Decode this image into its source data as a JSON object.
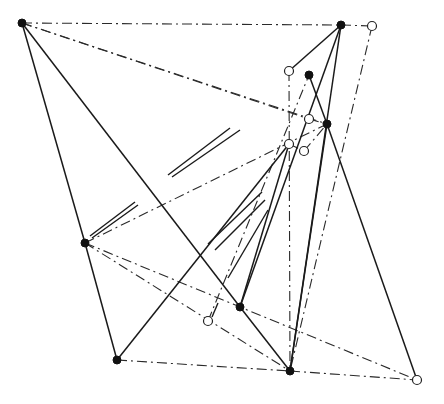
{
  "diagram": {
    "width": 444,
    "height": 404,
    "colors": {
      "line": "#1a1a1a",
      "background": "#ffffff"
    },
    "points": {
      "A": {
        "x": 22,
        "y": 23,
        "type": "filled"
      },
      "B": {
        "x": 341,
        "y": 25,
        "type": "filled"
      },
      "C": {
        "x": 372,
        "y": 26,
        "type": "hollow"
      },
      "D": {
        "x": 289,
        "y": 71,
        "type": "hollow"
      },
      "E": {
        "x": 309,
        "y": 75,
        "type": "filled"
      },
      "F": {
        "x": 309,
        "y": 119,
        "type": "hollow"
      },
      "G": {
        "x": 327,
        "y": 124,
        "type": "filled"
      },
      "H": {
        "x": 289,
        "y": 144,
        "type": "hollow"
      },
      "I": {
        "x": 304,
        "y": 151,
        "type": "hollow"
      },
      "J": {
        "x": 85,
        "y": 243,
        "type": "filled"
      },
      "K": {
        "x": 240,
        "y": 307,
        "type": "filled"
      },
      "L": {
        "x": 208,
        "y": 321,
        "type": "hollow"
      },
      "M": {
        "x": 117,
        "y": 360,
        "type": "filled"
      },
      "N": {
        "x": 290,
        "y": 371,
        "type": "filled"
      },
      "O": {
        "x": 417,
        "y": 380,
        "type": "hollow"
      }
    },
    "solid_lines": [
      [
        "A",
        "J"
      ],
      [
        "A",
        "K"
      ],
      [
        "J",
        "M"
      ],
      [
        "K",
        "N"
      ],
      [
        "G",
        "O"
      ],
      [
        "B",
        "K"
      ],
      [
        "B",
        "N"
      ],
      [
        "B",
        "D"
      ],
      [
        "E",
        "G"
      ],
      [
        "G",
        "N"
      ],
      [
        "M",
        "H"
      ],
      [
        "K",
        "H"
      ]
    ],
    "dashdot_lines": [
      [
        "A",
        "B"
      ],
      [
        "B",
        "C"
      ],
      [
        "A",
        "G"
      ],
      [
        "A",
        "F"
      ],
      [
        "M",
        "N"
      ],
      [
        "N",
        "O"
      ],
      [
        "J",
        "O"
      ],
      [
        "J",
        "N"
      ],
      [
        "C",
        "N"
      ],
      [
        "D",
        "N"
      ],
      [
        "H",
        "I"
      ],
      [
        "I",
        "G"
      ],
      [
        "F",
        "G"
      ],
      [
        "L",
        "E"
      ],
      [
        "J",
        "G"
      ]
    ],
    "partial_segments": [
      {
        "x1": 168,
        "y1": 175,
        "x2": 230,
        "y2": 128
      },
      {
        "x1": 172,
        "y1": 177,
        "x2": 240,
        "y2": 130
      },
      {
        "x1": 90,
        "y1": 236,
        "x2": 135,
        "y2": 202
      },
      {
        "x1": 92,
        "y1": 238,
        "x2": 138,
        "y2": 205
      },
      {
        "x1": 208,
        "y1": 244,
        "x2": 262,
        "y2": 192
      },
      {
        "x1": 215,
        "y1": 250,
        "x2": 265,
        "y2": 200
      },
      {
        "x1": 228,
        "y1": 278,
        "x2": 268,
        "y2": 210
      },
      {
        "x1": 212,
        "y1": 317,
        "x2": 218,
        "y2": 303
      }
    ]
  }
}
